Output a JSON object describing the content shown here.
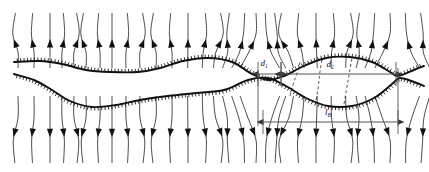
{
  "figure": {
    "type": "vector-field-schematic",
    "background_color": "#ffffff",
    "line_color": "#111111",
    "dimension_line_color": "#555555",
    "width": 429,
    "height": 172
  },
  "annotations": {
    "gap": {
      "symbol": "d",
      "subscript": "1",
      "x": 264,
      "y": 66
    },
    "width": {
      "symbol": "d",
      "subscript": "2",
      "x": 330,
      "y": 67
    },
    "length": {
      "symbol": "l",
      "subscript": "B",
      "x": 328,
      "y": 115
    }
  },
  "dimensions": [
    {
      "name": "gap-dimension",
      "x1": 258,
      "x2": 281,
      "y": 74,
      "label": "d1"
    },
    {
      "name": "width-dimension",
      "x1": 281,
      "x2": 396,
      "y": 74,
      "label": "d2"
    },
    {
      "name": "length-dimension",
      "x1": 263,
      "x2": 398,
      "y": 122,
      "label": "lB"
    }
  ],
  "chart_data": {
    "type": "line",
    "title": "",
    "xlabel": "",
    "ylabel": "",
    "grid": false,
    "legend": "none",
    "xlim": [
      0,
      429
    ],
    "ylim": [
      0,
      172
    ],
    "series": [
      {
        "name": "upper-interface",
        "hatched": true,
        "hatch_side": "up",
        "points": [
          [
            14,
            62
          ],
          [
            40,
            61
          ],
          [
            62,
            64
          ],
          [
            86,
            70
          ],
          [
            110,
            72
          ],
          [
            138,
            72
          ],
          [
            160,
            68
          ],
          [
            183,
            61
          ],
          [
            208,
            58
          ],
          [
            232,
            62
          ],
          [
            252,
            74
          ],
          [
            268,
            80
          ],
          [
            284,
            76
          ],
          [
            304,
            66
          ],
          [
            326,
            58
          ],
          [
            350,
            57
          ],
          [
            372,
            62
          ],
          [
            390,
            72
          ],
          [
            398,
            76
          ],
          [
            414,
            70
          ],
          [
            424,
            66
          ]
        ]
      },
      {
        "name": "lower-interface",
        "hatched": true,
        "hatch_side": "down",
        "points": [
          [
            14,
            74
          ],
          [
            34,
            80
          ],
          [
            52,
            90
          ],
          [
            70,
            101
          ],
          [
            92,
            107
          ],
          [
            116,
            105
          ],
          [
            140,
            100
          ],
          [
            168,
            96
          ],
          [
            196,
            93
          ],
          [
            224,
            90
          ],
          [
            248,
            80
          ],
          [
            268,
            78
          ],
          [
            286,
            86
          ],
          [
            306,
            98
          ],
          [
            328,
            106
          ],
          [
            352,
            106
          ],
          [
            374,
            98
          ],
          [
            392,
            84
          ],
          [
            400,
            78
          ],
          [
            414,
            82
          ],
          [
            424,
            86
          ]
        ]
      }
    ],
    "streamlines_count": 30,
    "streamline_direction": "upward-arrowheads",
    "nodes": [
      {
        "name": "left-saddle-point",
        "x": 258,
        "y": 78
      },
      {
        "name": "right-saddle-point",
        "x": 398,
        "y": 78
      }
    ]
  }
}
